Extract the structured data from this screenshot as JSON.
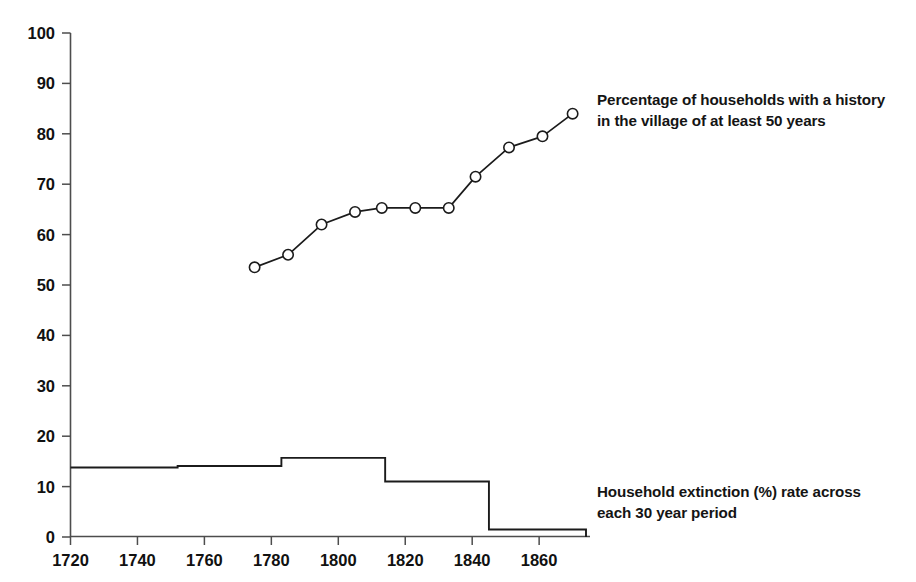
{
  "chart_data": {
    "type": "line",
    "title": "",
    "subtitle": "",
    "xlabel": "",
    "ylabel": "",
    "xlim": [
      1720,
      1874
    ],
    "ylim": [
      0,
      100
    ],
    "grid": false,
    "legend_position": "inline-right-annotations",
    "x_ticks": [
      1720,
      1740,
      1760,
      1780,
      1800,
      1820,
      1840,
      1860
    ],
    "x_tick_labels": [
      "1720",
      "1740",
      "1760",
      "1780",
      "1800",
      "1820",
      "1840",
      "1860"
    ],
    "y_ticks": [
      0,
      10,
      20,
      30,
      40,
      50,
      60,
      70,
      80,
      90,
      100
    ],
    "y_tick_labels": [
      "0",
      "10",
      "20",
      "30",
      "40",
      "50",
      "60",
      "70",
      "80",
      "90",
      "100"
    ],
    "series": [
      {
        "name": "Percentage of households with a history in the village of at least 50 years",
        "type": "line",
        "marker": "open-circle",
        "annotation": "Percentage of households with a history\nin the village of at least 50 years",
        "points": [
          {
            "x": 1775,
            "y": 53.5
          },
          {
            "x": 1785,
            "y": 56.0
          },
          {
            "x": 1795,
            "y": 62.0
          },
          {
            "x": 1805,
            "y": 64.5
          },
          {
            "x": 1813,
            "y": 65.3
          },
          {
            "x": 1823,
            "y": 65.3
          },
          {
            "x": 1833,
            "y": 65.3
          },
          {
            "x": 1841,
            "y": 71.5
          },
          {
            "x": 1851,
            "y": 77.3
          },
          {
            "x": 1861,
            "y": 79.5
          },
          {
            "x": 1870,
            "y": 84.0
          }
        ]
      },
      {
        "name": "Household extinction (%) rate across each 30 year period",
        "type": "step",
        "marker": "none",
        "annotation": "Household extinction (%) rate across\neach 30 year period",
        "steps": [
          {
            "x_start": 1720,
            "x_end": 1752,
            "y": 13.8
          },
          {
            "x_start": 1752,
            "x_end": 1783,
            "y": 14.1
          },
          {
            "x_start": 1783,
            "x_end": 1814,
            "y": 15.7
          },
          {
            "x_start": 1814,
            "x_end": 1845,
            "y": 11.0
          },
          {
            "x_start": 1845,
            "x_end": 1874,
            "y": 1.5
          }
        ]
      }
    ]
  },
  "annotations": {
    "line_series_label": "Percentage of households with a history\nin the village of at least 50 years",
    "step_series_label": "Household extinction (%) rate across\neach 30 year period"
  },
  "colors": {
    "background": "#ffffff",
    "ink": "#1b1b1b",
    "axis": "#4d4d4d",
    "marker_fill": "#ffffff"
  }
}
